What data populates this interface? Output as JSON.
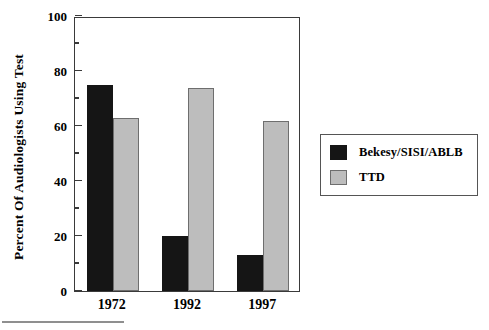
{
  "chart_data": {
    "type": "bar",
    "title": "",
    "xlabel": "",
    "ylabel": "Percent Of Audiologists Using Test",
    "categories": [
      "1972",
      "1992",
      "1997"
    ],
    "series": [
      {
        "name": "Bekesy/SISI/ABLB",
        "color": "#151515",
        "values": [
          75,
          20,
          13
        ]
      },
      {
        "name": "TTD",
        "color": "#bdbdbd",
        "values": [
          63,
          74,
          62
        ]
      }
    ],
    "ylim": [
      0,
      100
    ],
    "yticks": [
      0,
      20,
      40,
      60,
      80,
      100
    ],
    "ytick_labels": [
      "0",
      "20",
      "40",
      "60",
      "80",
      "100"
    ],
    "yminor_ticks": [
      10,
      30,
      50,
      70,
      90
    ],
    "grid": false,
    "legend_position": "right",
    "legend_entries": [
      "Bekesy/SISI/ABLB",
      "TTD"
    ]
  },
  "legend": {
    "items": [
      {
        "label": "Bekesy/SISI/ABLB"
      },
      {
        "label": "TTD"
      }
    ]
  },
  "axes": {
    "y_title": "Percent Of Audiologists Using Test"
  }
}
